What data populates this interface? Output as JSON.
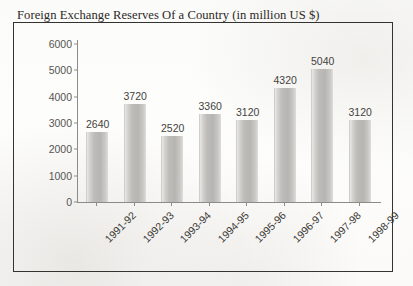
{
  "chart_data": {
    "type": "bar",
    "title": "Foreign Exchange Reserves Of a Country (in million US $)",
    "xlabel": "",
    "ylabel": "",
    "categories": [
      "1991-92",
      "1992-93",
      "1993-94",
      "1994-95",
      "1995-96",
      "1996-97",
      "1997-98",
      "1998-99"
    ],
    "values": [
      2640,
      3720,
      2520,
      3360,
      3120,
      4320,
      5040,
      3120
    ],
    "value_labels": [
      "2640",
      "3720",
      "2520",
      "3360",
      "3120",
      "4320",
      "5040",
      "3120"
    ],
    "ylim": [
      0,
      6000
    ],
    "y_ticks": [
      0,
      1000,
      2000,
      3000,
      4000,
      5000,
      6000
    ],
    "y_tick_labels": [
      "0",
      "1000",
      "2000",
      "3000",
      "4000",
      "5000",
      "6000"
    ],
    "grid": false,
    "legend": false,
    "bar_color": "#bdbcb9",
    "axis_color": "#8d8b87",
    "text_color": "#3d3b38"
  }
}
